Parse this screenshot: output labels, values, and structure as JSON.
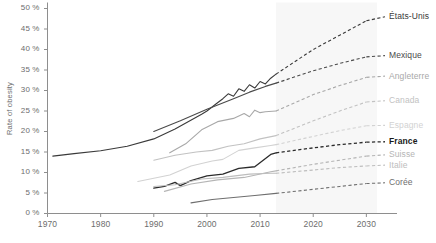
{
  "chart_data": {
    "type": "line",
    "title": "",
    "xlabel": "",
    "ylabel": "Rate of obesity",
    "xlim": [
      1970,
      2032
    ],
    "ylim": [
      0,
      50
    ],
    "xticks": [
      1970,
      1980,
      1990,
      2000,
      2010,
      2020,
      2030
    ],
    "yticks": [
      0,
      5,
      10,
      15,
      20,
      25,
      30,
      35,
      40,
      45,
      50
    ],
    "ytick_labels": [
      "0 %",
      "5 %",
      "10 %",
      "15 %",
      "20 %",
      "25 %",
      "30 %",
      "35 %",
      "40 %",
      "45 %",
      "50 %"
    ],
    "xtick_labels": [
      "1970",
      "1980",
      "1990",
      "2000",
      "2010",
      "2020",
      "2030"
    ],
    "grid": false,
    "legend_position": "right-inline",
    "projection_start_year": 2013,
    "projection_shading": {
      "from": 2013,
      "to": 2032,
      "color": "#f7f7f7"
    },
    "series": [
      {
        "name": "États-Unis",
        "color": "#3a3a3a",
        "bold_label": false,
        "label_y_percent": 48.0,
        "historical": [
          [
            1971,
            14.0
          ],
          [
            1975,
            14.6
          ],
          [
            1980,
            15.3
          ],
          [
            1985,
            16.4
          ],
          [
            1990,
            18.2
          ],
          [
            1994,
            20.6
          ],
          [
            1999,
            24.2
          ],
          [
            2000,
            25.0
          ],
          [
            2002,
            27.0
          ],
          [
            2003,
            28.0
          ],
          [
            2004,
            29.2
          ],
          [
            2005,
            28.6
          ],
          [
            2006,
            30.4
          ],
          [
            2007,
            29.8
          ],
          [
            2008,
            31.4
          ],
          [
            2009,
            30.6
          ],
          [
            2010,
            32.2
          ],
          [
            2011,
            31.6
          ],
          [
            2012,
            33.0
          ],
          [
            2013,
            34.0
          ]
        ],
        "projection": [
          [
            2013,
            34.0
          ],
          [
            2020,
            40.0
          ],
          [
            2025,
            43.5
          ],
          [
            2030,
            47.0
          ]
        ]
      },
      {
        "name": "Mexique",
        "color": "#4a4a4a",
        "bold_label": false,
        "label_y_percent": 38.5,
        "historical": [
          [
            1990,
            20.0
          ],
          [
            1995,
            22.6
          ],
          [
            2000,
            25.4
          ],
          [
            2005,
            28.0
          ],
          [
            2008,
            29.6
          ],
          [
            2011,
            31.0
          ],
          [
            2013,
            31.8
          ]
        ],
        "projection": [
          [
            2013,
            31.8
          ],
          [
            2020,
            34.8
          ],
          [
            2025,
            36.6
          ],
          [
            2030,
            38.2
          ]
        ]
      },
      {
        "name": "Angleterre",
        "color": "#a8a8a8",
        "bold_label": false,
        "label_y_percent": 33.5,
        "historical": [
          [
            1993,
            14.8
          ],
          [
            1996,
            17.0
          ],
          [
            1999,
            20.4
          ],
          [
            2002,
            22.4
          ],
          [
            2005,
            23.2
          ],
          [
            2007,
            24.4
          ],
          [
            2008,
            23.6
          ],
          [
            2009,
            25.2
          ],
          [
            2010,
            24.6
          ],
          [
            2011,
            24.8
          ],
          [
            2013,
            25.0
          ]
        ],
        "projection": [
          [
            2013,
            25.0
          ],
          [
            2020,
            29.0
          ],
          [
            2025,
            31.2
          ],
          [
            2030,
            33.2
          ]
        ]
      },
      {
        "name": "Canada",
        "color": "#c2c2c2",
        "bold_label": false,
        "label_y_percent": 27.5,
        "historical": [
          [
            1990,
            13.0
          ],
          [
            1994,
            14.2
          ],
          [
            1998,
            15.0
          ],
          [
            2001,
            15.4
          ],
          [
            2004,
            16.4
          ],
          [
            2007,
            17.0
          ],
          [
            2010,
            18.2
          ],
          [
            2013,
            19.0
          ]
        ],
        "projection": [
          [
            2013,
            19.0
          ],
          [
            2020,
            22.6
          ],
          [
            2025,
            25.0
          ],
          [
            2030,
            27.2
          ]
        ]
      },
      {
        "name": "Espagne",
        "color": "#d2d2d2",
        "bold_label": false,
        "label_y_percent": 21.5,
        "historical": [
          [
            1987,
            7.8
          ],
          [
            1993,
            9.4
          ],
          [
            1997,
            11.6
          ],
          [
            2001,
            12.8
          ],
          [
            2003,
            13.2
          ],
          [
            2006,
            15.4
          ],
          [
            2009,
            16.0
          ],
          [
            2012,
            16.6
          ],
          [
            2013,
            16.8
          ]
        ],
        "projection": [
          [
            2013,
            16.8
          ],
          [
            2020,
            18.8
          ],
          [
            2025,
            20.2
          ],
          [
            2030,
            21.4
          ]
        ]
      },
      {
        "name": "France",
        "color": "#2b2b2b",
        "bold_label": true,
        "label_y_percent": 17.5,
        "historical": [
          [
            1990,
            6.2
          ],
          [
            1992,
            6.6
          ],
          [
            1994,
            7.6
          ],
          [
            1995,
            6.8
          ],
          [
            1997,
            8.0
          ],
          [
            2000,
            9.2
          ],
          [
            2003,
            9.6
          ],
          [
            2006,
            11.0
          ],
          [
            2009,
            11.4
          ],
          [
            2012,
            14.4
          ],
          [
            2013,
            14.8
          ]
        ],
        "projection": [
          [
            2013,
            14.8
          ],
          [
            2020,
            16.0
          ],
          [
            2025,
            16.8
          ],
          [
            2030,
            17.4
          ]
        ]
      },
      {
        "name": "Suisse",
        "color": "#b5b5b5",
        "bold_label": false,
        "label_y_percent": 14.3,
        "historical": [
          [
            1992,
            5.4
          ],
          [
            1997,
            7.2
          ],
          [
            2002,
            8.2
          ],
          [
            2007,
            8.8
          ],
          [
            2012,
            10.2
          ],
          [
            2013,
            10.4
          ]
        ],
        "projection": [
          [
            2013,
            10.4
          ],
          [
            2020,
            12.0
          ],
          [
            2025,
            13.0
          ],
          [
            2030,
            14.0
          ]
        ]
      },
      {
        "name": "Italie",
        "color": "#bdbdbd",
        "bold_label": false,
        "label_y_percent": 11.8,
        "historical": [
          [
            1990,
            6.6
          ],
          [
            1994,
            7.0
          ],
          [
            1999,
            8.4
          ],
          [
            2003,
            8.8
          ],
          [
            2008,
            9.6
          ],
          [
            2012,
            9.8
          ],
          [
            2013,
            9.8
          ]
        ],
        "projection": [
          [
            2013,
            9.8
          ],
          [
            2020,
            10.6
          ],
          [
            2025,
            11.2
          ],
          [
            2030,
            11.6
          ]
        ]
      },
      {
        "name": "Corée",
        "color": "#6e6e6e",
        "bold_label": false,
        "label_y_percent": 7.5,
        "historical": [
          [
            1997,
            2.6
          ],
          [
            2001,
            3.4
          ],
          [
            2005,
            3.9
          ],
          [
            2009,
            4.4
          ],
          [
            2013,
            4.9
          ]
        ],
        "projection": [
          [
            2013,
            4.9
          ],
          [
            2020,
            5.9
          ],
          [
            2025,
            6.6
          ],
          [
            2030,
            7.3
          ]
        ]
      }
    ]
  },
  "axis": {
    "ylabel": "Rate of obesity",
    "ytick_labels": [
      "50 %",
      "45 %",
      "40 %",
      "35 %",
      "30 %",
      "25 %",
      "20 %",
      "15 %",
      "10 %",
      "5 %",
      "0 %"
    ],
    "xtick_labels": [
      "1970",
      "1980",
      "1990",
      "2000",
      "2010",
      "2020",
      "2030"
    ]
  }
}
